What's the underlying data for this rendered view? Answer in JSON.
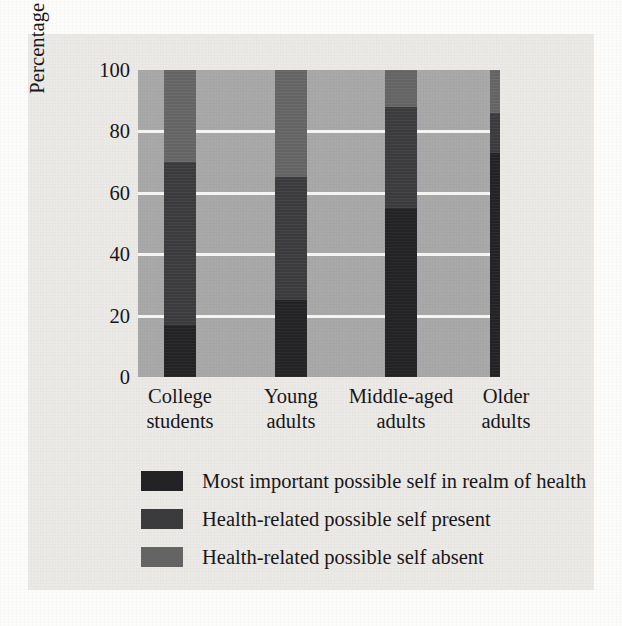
{
  "figure": {
    "background_color": "#eceae6",
    "plot_background_color": "#a9a9a9",
    "gridline_color": "#f4f4f2",
    "caption_text": ""
  },
  "chart_data": {
    "type": "bar",
    "stacked": true,
    "stack_mode": "percent",
    "title": "",
    "xlabel": "",
    "ylabel": "Percentage of sample",
    "ylim": [
      0,
      100
    ],
    "yticks": [
      0,
      20,
      40,
      60,
      80,
      100
    ],
    "ytick_labels": [
      "0",
      "20",
      "40",
      "60",
      "80",
      "100"
    ],
    "grid": true,
    "grid_axis": "y",
    "legend_position": "below",
    "categories": [
      "College students",
      "Young adults",
      "Middle-aged adults",
      "Older adults"
    ],
    "category_lines": [
      [
        "College",
        "students"
      ],
      [
        "Young",
        "adults"
      ],
      [
        "Middle-aged",
        "adults"
      ],
      [
        "Older",
        "adults"
      ]
    ],
    "series": [
      {
        "name": "Most important possible self in realm of health",
        "color": "#232325",
        "values": [
          17,
          25,
          55,
          73
        ]
      },
      {
        "name": "Health-related possible self present",
        "color": "#3b3b3d",
        "values": [
          53,
          40,
          33,
          13
        ]
      },
      {
        "name": "Health-related possible self absent",
        "color": "#646464",
        "values": [
          30,
          35,
          12,
          14
        ]
      }
    ],
    "cumulative_boundaries": [
      [
        17,
        70,
        100
      ],
      [
        25,
        65,
        100
      ],
      [
        55,
        88,
        100
      ],
      [
        73,
        86,
        100
      ]
    ]
  },
  "legend": {
    "items": [
      {
        "label": "Most important possible self in realm of health",
        "color": "#232325"
      },
      {
        "label": "Health-related possible self present",
        "color": "#3b3b3d"
      },
      {
        "label": "Health-related possible self absent",
        "color": "#646464"
      }
    ]
  }
}
